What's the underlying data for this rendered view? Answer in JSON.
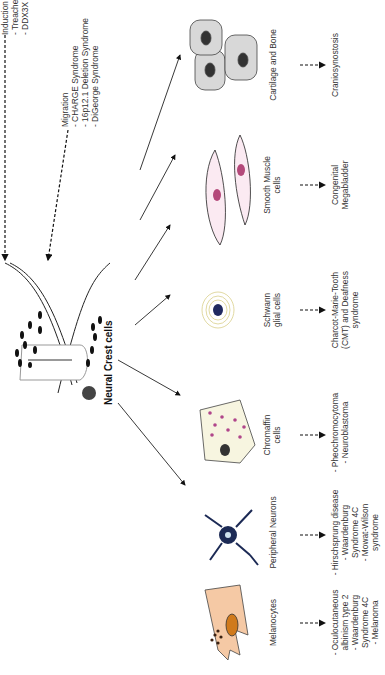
{
  "title": "Neural Crest cells",
  "stages": [
    {
      "label": "Induction and EMT",
      "disorders": [
        "- Treacher Collins Syndrome",
        "- DDX3X Syndrome"
      ]
    },
    {
      "label": "Migration",
      "disorders": [
        "- CHARGE Syndrome",
        "- 16p12.1 Deletion Syndrome",
        "- DiGeorge Syndrome"
      ]
    }
  ],
  "derivatives": [
    {
      "name": "Melanocytes",
      "disorders": [
        "- Oculocutaneous",
        "albinism type 2",
        "- Waardenburg",
        "Syndrome 4C",
        "- Melanoma"
      ]
    },
    {
      "name": "Peripheral Neurons",
      "disorders": [
        "- Hirschsprung disease",
        "- Waardenburg",
        "Syndrome 4C",
        "- Mowat-Wilson",
        "syndrome"
      ]
    },
    {
      "name": "Chromaffin cells",
      "name_lines": [
        "Chromaffin",
        "cells"
      ],
      "disorders": [
        "- Pheochromocytoma",
        "- Neuroblastoma"
      ]
    },
    {
      "name": "Schwann glial cells",
      "name_lines": [
        "Schwann",
        "glial cells"
      ],
      "disorders": [
        "Charcot-Marie-Tooth",
        "(CMT) and Deafness",
        "syndrome"
      ]
    },
    {
      "name": "Smooth Muscle cells",
      "name_lines": [
        "Smooth Muscle",
        "cells"
      ],
      "disorders": [
        "Congenital",
        "Megabladder"
      ]
    },
    {
      "name": "Cartilage and Bone",
      "disorders": [
        "Craniosynostosis"
      ]
    }
  ],
  "colors": {
    "melanocyte": "#f5c9a5",
    "melanocyte_nucleus": "#d07a1c",
    "neuron": "#1c2a55",
    "chromaffin_fill": "#f7f5e0",
    "granule": "#b0468a",
    "schwann_ring": "#d9cf8a",
    "schwann_nucleus": "#202a60",
    "muscle_fill": "#fbeaf2",
    "muscle_nucleus": "#b4497a",
    "bone_fill": "#d8d8d8",
    "bone_nucleus": "#333333"
  }
}
